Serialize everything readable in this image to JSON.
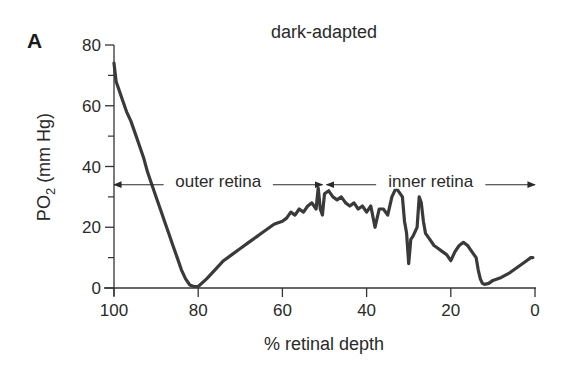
{
  "panel_label": "A",
  "chart_data": {
    "type": "line",
    "title": "dark-adapted",
    "xlabel": "% retinal depth",
    "ylabel": "PO2 (mm Hg)",
    "ylabel_main": "PO",
    "ylabel_sub": "2",
    "ylabel_units": " (mm Hg)",
    "xlim": [
      100,
      0
    ],
    "ylim": [
      0,
      80
    ],
    "x_ticks": [
      100,
      80,
      60,
      40,
      20,
      0
    ],
    "x_tick_labels": [
      "100",
      "80",
      "60",
      "40",
      "20",
      "0"
    ],
    "y_ticks": [
      0,
      20,
      40,
      60,
      80
    ],
    "y_tick_labels": [
      "0",
      "20",
      "40",
      "60",
      "80"
    ],
    "y_minor_ticks": [
      10,
      30,
      50,
      70
    ],
    "grid": false,
    "legend": null,
    "annotations": [
      {
        "text": "outer retina",
        "x_range": [
          100,
          50
        ],
        "y": 34
      },
      {
        "text": "inner retina",
        "x_range": [
          50,
          0
        ],
        "y": 34
      }
    ],
    "series": [
      {
        "name": "PO2 profile (dark-adapted)",
        "x": [
          100,
          99.5,
          99,
          98,
          97,
          96,
          95,
          94,
          93,
          92,
          91,
          90,
          89,
          88,
          87,
          86,
          85,
          84,
          83,
          82,
          81,
          80,
          78,
          76,
          74,
          72,
          70,
          68,
          66,
          65,
          64,
          62,
          60,
          59,
          58,
          57,
          56,
          55,
          54,
          53,
          52,
          51.5,
          51,
          50.5,
          50,
          49,
          48,
          47,
          46,
          45,
          44,
          43,
          42,
          41,
          40,
          39,
          38,
          37,
          36,
          35,
          34,
          33,
          32.5,
          32,
          31.5,
          31,
          30.5,
          30,
          29.5,
          29,
          28,
          27.5,
          27,
          26.5,
          26,
          25,
          24,
          23,
          22,
          21,
          20,
          19,
          18,
          17,
          16,
          15,
          14,
          13.5,
          13,
          12.5,
          12,
          11,
          10,
          8,
          6,
          4,
          2,
          1,
          0.5
        ],
        "y": [
          74,
          68,
          66,
          62,
          58,
          55,
          51,
          47,
          43,
          38,
          34,
          30,
          26,
          22,
          18,
          14,
          10,
          6,
          3,
          1,
          0.5,
          0.5,
          3,
          6,
          9,
          11,
          13,
          15,
          17,
          18,
          19,
          21,
          22,
          23,
          25,
          24,
          26,
          25,
          27,
          28,
          26,
          33,
          26,
          24,
          31,
          32,
          30,
          29,
          30,
          28,
          27,
          28,
          26,
          27,
          25,
          27,
          20,
          26,
          26,
          24,
          30,
          33,
          32,
          31,
          30,
          22,
          18,
          8,
          16,
          17,
          20,
          30,
          28,
          22,
          18,
          16,
          14,
          13,
          12,
          11,
          9,
          12,
          14,
          15,
          14,
          12,
          10,
          6,
          3,
          1.5,
          1.2,
          1.5,
          2.5,
          3.5,
          5,
          7,
          9,
          10,
          10
        ]
      }
    ]
  }
}
